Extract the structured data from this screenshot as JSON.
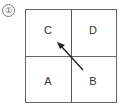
{
  "figure": {
    "number_label": "①",
    "cells": [
      {
        "label": "C",
        "position": "top-left"
      },
      {
        "label": "D",
        "position": "top-right"
      },
      {
        "label": "A",
        "position": "bottom-left"
      },
      {
        "label": "B",
        "position": "bottom-right"
      }
    ],
    "arrow": {
      "from": "B",
      "to": "C",
      "direction": "diagonal-up-left"
    },
    "colors": {
      "line": "#666666",
      "arrow": "#222222",
      "text": "#333333"
    }
  }
}
